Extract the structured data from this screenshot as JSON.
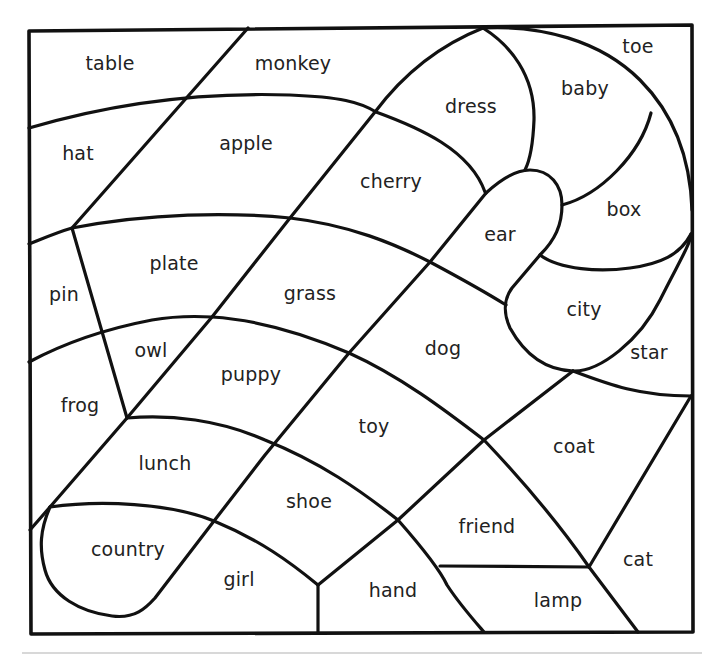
{
  "worksheet": {
    "type": "color-by-word coloring page",
    "regions": [
      {
        "id": "table",
        "label": "table",
        "x": 110,
        "y": 63
      },
      {
        "id": "monkey",
        "label": "monkey",
        "x": 293,
        "y": 63
      },
      {
        "id": "toe",
        "label": "toe",
        "x": 638,
        "y": 46
      },
      {
        "id": "baby",
        "label": "baby",
        "x": 585,
        "y": 88
      },
      {
        "id": "dress",
        "label": "dress",
        "x": 471,
        "y": 106
      },
      {
        "id": "hat",
        "label": "hat",
        "x": 78,
        "y": 153
      },
      {
        "id": "apple",
        "label": "apple",
        "x": 246,
        "y": 143
      },
      {
        "id": "cherry",
        "label": "cherry",
        "x": 391,
        "y": 181
      },
      {
        "id": "box",
        "label": "box",
        "x": 624,
        "y": 209
      },
      {
        "id": "ear",
        "label": "ear",
        "x": 500,
        "y": 234
      },
      {
        "id": "plate",
        "label": "plate",
        "x": 174,
        "y": 263
      },
      {
        "id": "pin",
        "label": "pin",
        "x": 64,
        "y": 294
      },
      {
        "id": "grass",
        "label": "grass",
        "x": 310,
        "y": 293
      },
      {
        "id": "city",
        "label": "city",
        "x": 584,
        "y": 309
      },
      {
        "id": "owl",
        "label": "owl",
        "x": 151,
        "y": 350
      },
      {
        "id": "dog",
        "label": "dog",
        "x": 443,
        "y": 348
      },
      {
        "id": "star",
        "label": "star",
        "x": 649,
        "y": 352
      },
      {
        "id": "puppy",
        "label": "puppy",
        "x": 251,
        "y": 374
      },
      {
        "id": "frog",
        "label": "frog",
        "x": 80,
        "y": 405
      },
      {
        "id": "toy",
        "label": "toy",
        "x": 374,
        "y": 426
      },
      {
        "id": "coat",
        "label": "coat",
        "x": 574,
        "y": 446
      },
      {
        "id": "lunch",
        "label": "lunch",
        "x": 165,
        "y": 463
      },
      {
        "id": "shoe",
        "label": "shoe",
        "x": 309,
        "y": 501
      },
      {
        "id": "friend",
        "label": "friend",
        "x": 487,
        "y": 526
      },
      {
        "id": "country",
        "label": "country",
        "x": 128,
        "y": 549
      },
      {
        "id": "cat",
        "label": "cat",
        "x": 638,
        "y": 559
      },
      {
        "id": "girl",
        "label": "girl",
        "x": 239,
        "y": 579
      },
      {
        "id": "hand",
        "label": "hand",
        "x": 393,
        "y": 590
      },
      {
        "id": "lamp",
        "label": "lamp",
        "x": 558,
        "y": 600
      }
    ]
  }
}
